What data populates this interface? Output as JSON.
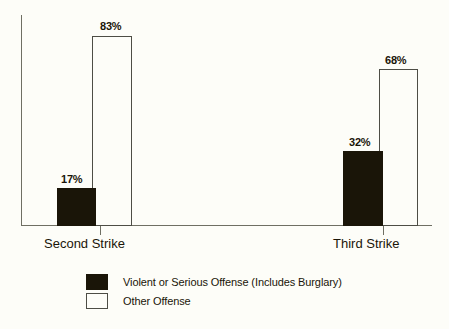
{
  "chart_data": {
    "type": "bar",
    "title": "",
    "subtitle": "",
    "xlabel": "",
    "ylabel": "",
    "ylim": [
      0,
      100
    ],
    "grid": false,
    "legend_position": "bottom",
    "categories": [
      "Second Strike",
      "Third Strike"
    ],
    "series": [
      {
        "name": "Violent or Serious Offense (Includes Burglary)",
        "color": "#1a1508",
        "values": [
          17,
          32
        ],
        "value_labels": [
          "17%",
          "68%"
        ]
      },
      {
        "name": "Other Offense",
        "color": "#fdfdf8",
        "values": [
          83,
          68
        ],
        "value_labels": [
          "83%",
          "68%"
        ]
      }
    ],
    "bars": [
      {
        "category": "Second Strike",
        "series": "Violent or Serious Offense (Includes Burglary)",
        "value": 17,
        "label": "17%"
      },
      {
        "category": "Second Strike",
        "series": "Other Offense",
        "value": 83,
        "label": "83%"
      },
      {
        "category": "Third Strike",
        "series": "Violent or Serious Offense (Includes Burglary)",
        "value": 32,
        "label": "32%"
      },
      {
        "category": "Third Strike",
        "series": "Other Offense",
        "value": 68,
        "label": "68%"
      }
    ],
    "annotations": []
  },
  "axis": {
    "category_labels": {
      "second": "Second Strike",
      "third": "Third Strike"
    }
  },
  "values": {
    "second_dark": "17%",
    "second_light": "83%",
    "third_dark": "32%",
    "third_light": "68%"
  },
  "legend": {
    "items": [
      {
        "label": "Violent or Serious Offense (Includes Burglary)",
        "swatch": "filled-black-square"
      },
      {
        "label": "Other Offense",
        "swatch": "outlined-white-square"
      }
    ]
  },
  "colors": {
    "background": "#fdfdf8",
    "ink": "#1a1508",
    "axis": "#6f6f63",
    "bar_outline": "#4d4d45"
  }
}
